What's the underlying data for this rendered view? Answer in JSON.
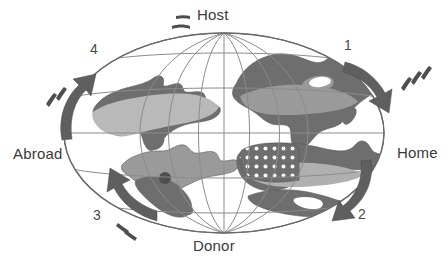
{
  "figure": {
    "type": "schematic-globe-diagram",
    "title_visible": false,
    "background_color": "#ffffff",
    "axis_labels": {
      "top": "Host",
      "bottom": "Donor",
      "right": "Home",
      "left": "Abroad"
    },
    "arrow_numbers": {
      "top_right": "1",
      "bottom_right": "2",
      "bottom_left": "3",
      "top_left": "4"
    },
    "colors": {
      "land_dark": "#6e6e6e",
      "land_mid": "#8a8a8a",
      "land_light": "#b9b9b9",
      "graticule": "#8b8b8b",
      "outline": "#5a5a5a",
      "arrow": "#5f5f5f",
      "text": "#3a3a3a",
      "dot_fill": "#ffffff"
    },
    "globe": {
      "projection": "oval",
      "center_x": 224,
      "center_y": 133,
      "radius_x": 160,
      "radius_y": 100,
      "meridian_count": 7,
      "parallel_count": 5,
      "graticule_visible": true
    },
    "arrows": [
      {
        "id": "1",
        "position": "right-upper-limb",
        "direction": "downward",
        "motion_dashes": true,
        "dash_side": "right"
      },
      {
        "id": "2",
        "position": "bottom-right-limb",
        "direction": "downward-left",
        "motion_dashes": false,
        "dash_side": "none"
      },
      {
        "id": "3",
        "position": "bottom-left-limb",
        "direction": "upward",
        "motion_dashes": true,
        "dash_side": "below"
      },
      {
        "id": "4",
        "position": "left-upper-limb",
        "direction": "upward",
        "motion_dashes": true,
        "dash_side": "left"
      }
    ],
    "landmasses": [
      {
        "name": "africa-rotated",
        "shade": "dark",
        "has_light_band": true
      },
      {
        "name": "north-america-rotated",
        "shade": "dark",
        "has_light_band": true
      },
      {
        "name": "south-america-rotated",
        "shade": "mixed",
        "has_dot_marker": true
      },
      {
        "name": "eurasia-rotated",
        "shade": "dark",
        "has_stipple_pattern": true
      },
      {
        "name": "australia-rotated",
        "shade": "dark",
        "has_light_band": false
      }
    ],
    "motion_dashes": {
      "top_left_of_host": true,
      "count_near_host": 2
    }
  }
}
